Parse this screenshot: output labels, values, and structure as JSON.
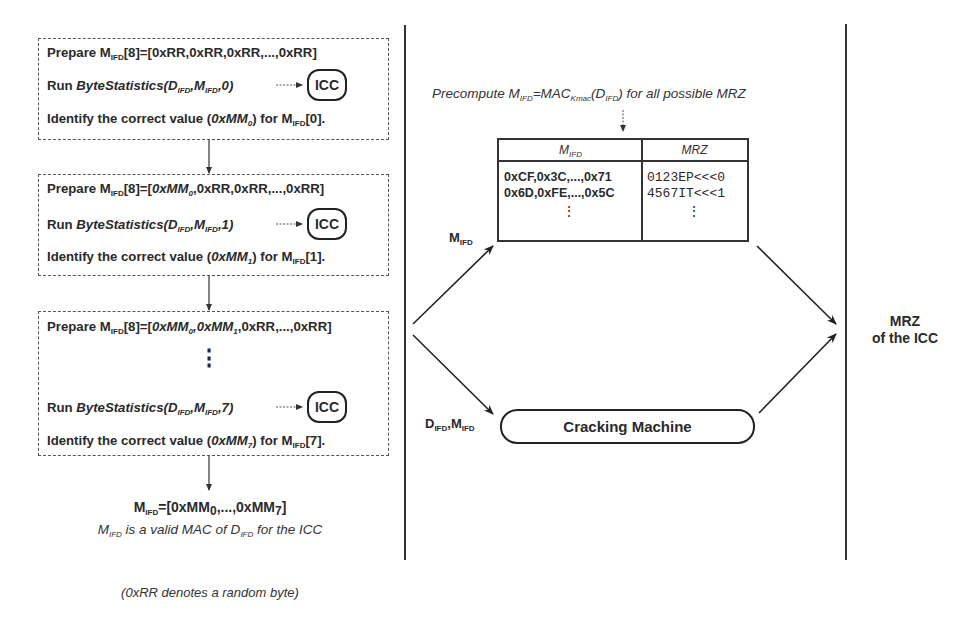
{
  "left_panel": {
    "step1": {
      "prepare": {
        "pre": "Prepare M",
        "sub": "IFD",
        "post": "[8]=[0xRR,0xRR,0xRR,...,0xRR]"
      },
      "run": {
        "pre": "Run ",
        "fn": "ByteStatistics(D",
        "s1": "IFD",
        "mid": ",M",
        "s2": "IFD",
        "arg": ",0)"
      },
      "identify": {
        "pre": "Identify the correct value (",
        "val": "0xMM",
        "vsub": "0",
        "mid": ") for M",
        "sub": "IFD",
        "post": "[0]."
      },
      "icc": "ICC"
    },
    "step2": {
      "prepare": {
        "pre": "Prepare M",
        "sub": "IFD",
        "post1": "[8]=[",
        "it1": "0xMM",
        "it1sub": "0",
        "post": ",0xRR,0xRR,...,0xRR]"
      },
      "run": {
        "pre": "Run ",
        "fn": "ByteStatistics(D",
        "s1": "IFD",
        "mid": ",M",
        "s2": "IFD",
        "arg": ",1)"
      },
      "identify": {
        "pre": "Identify the correct value (",
        "val": "0xMM",
        "vsub": "1",
        "mid": ") for M",
        "sub": "IFD",
        "post": "[1]."
      },
      "icc": "ICC"
    },
    "step3": {
      "prepare": {
        "pre": "Prepare M",
        "sub": "IFD",
        "post1": "[8]=[",
        "it1": "0xMM",
        "it1sub": "0",
        "it2": ",0xMM",
        "it2sub": "1",
        "post": ",0xRR,...,0xRR]"
      },
      "ellipsis": "⋮",
      "run": {
        "pre": "Run ",
        "fn": "ByteStatistics(D",
        "s1": "IFD",
        "mid": ",M",
        "s2": "IFD",
        "arg": ",7)"
      },
      "identify": {
        "pre": "Identify the correct value (",
        "val": "0xMM",
        "vsub": "7",
        "mid": ") for M",
        "sub": "IFD",
        "post": "[7]."
      },
      "icc": "ICC"
    },
    "result": {
      "m": "M",
      "msub": "IFD",
      "eq": "=[0xMM",
      "s0": "0",
      "mid": ",...,0xMM",
      "s7": "7",
      "end": "]",
      "desc_m": "M",
      "desc_msub": "IFD",
      "desc_mid": " is a valid MAC of D",
      "desc_dsub": "IFD",
      "desc_end": " for the ICC"
    },
    "footnote": "(0xRR denotes a random byte)"
  },
  "middle_panel": {
    "precompute": {
      "pre": "Precompute M",
      "s1": "IFD",
      "mid": "=MAC",
      "s2": "Kmac",
      "mid2": "(D",
      "s3": "IFD",
      "end": ") for all possible MRZ"
    },
    "table": {
      "headers": [
        {
          "text": "M",
          "sub": "IFD"
        },
        {
          "text": "MRZ",
          "sub": ""
        }
      ],
      "rows": [
        {
          "mac": "0xCF,0x3C,...,0x71",
          "mrz": "0123EP<<<0"
        },
        {
          "mac": "0x6D,0xFE,...,0x5C",
          "mrz": "4567IT<<<1"
        }
      ],
      "ellipsis": "⋮"
    },
    "arrow_label_top": {
      "text": "M",
      "sub": "IFD"
    },
    "arrow_label_bottom": {
      "t1": "D",
      "s1": "IFD",
      "t2": ",M",
      "s2": "IFD"
    },
    "cracking_machine": "Cracking Machine"
  },
  "right_panel": {
    "result_line1": "MRZ",
    "result_line2": "of the ICC"
  }
}
